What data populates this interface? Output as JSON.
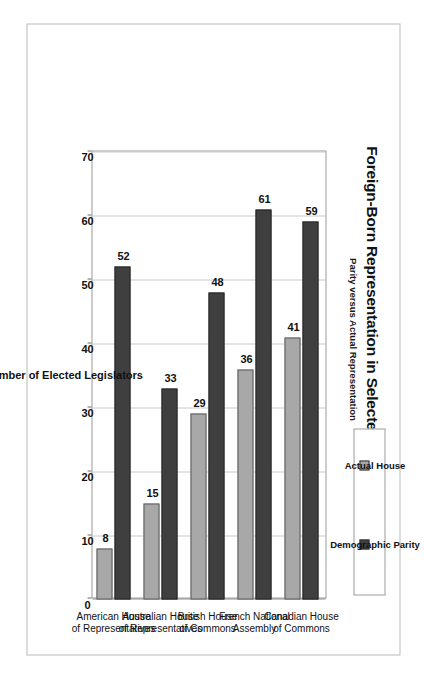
{
  "chart_data": {
    "type": "bar",
    "orientation": "vertical-printed-sideways",
    "title": "Foreign-Born Representation in Selected Legislatures",
    "subtitle": "Parity versus Actual Representation",
    "xlabel": "",
    "ylabel": "Number of Elected Legislators",
    "ylim": [
      0,
      70
    ],
    "yticks": [
      0,
      10,
      20,
      30,
      40,
      50,
      60,
      70
    ],
    "grid": "value-axis gridlines only",
    "legend_position": "top-right",
    "categories": [
      "Canadian House of Commons",
      "French National Assembly",
      "British House of Commons",
      "Australian House of Representatives",
      "American House of Representatives"
    ],
    "category_lines": [
      [
        "Canadian House",
        "of Commons"
      ],
      [
        "French National",
        "Assembly"
      ],
      [
        "British House",
        "of Commons"
      ],
      [
        "Australian House",
        "of Representatives"
      ],
      [
        "American House",
        "of Representatives"
      ]
    ],
    "series": [
      {
        "name": "Actual House",
        "color": "#a8a8a8",
        "values": [
          41,
          36,
          29,
          15,
          8
        ]
      },
      {
        "name": "Demographic Parity",
        "color": "#3f3f3f",
        "values": [
          59,
          61,
          48,
          33,
          52
        ]
      }
    ]
  },
  "legend": {
    "items": [
      {
        "label": "Actual House",
        "color": "#a8a8a8"
      },
      {
        "label": "Demographic Parity",
        "color": "#3f3f3f"
      }
    ]
  },
  "axis": {
    "value_axis_title": "Number of Elected Legislators",
    "tick_labels": [
      "0",
      "10",
      "20",
      "30",
      "40",
      "50",
      "60",
      "70"
    ]
  },
  "data_labels": {
    "canadian_actual": "41",
    "canadian_parity": "59",
    "french_actual": "36",
    "french_parity": "61",
    "british_actual": "29",
    "british_parity": "48",
    "australian_actual": "15",
    "australian_parity": "33",
    "american_actual": "8",
    "american_parity": "52"
  },
  "colors": {
    "actual": "#a8a8a8",
    "parity": "#3f3f3f",
    "grid": "#c9c9c9",
    "frame": "#9a9a9a",
    "text": "#111111"
  }
}
